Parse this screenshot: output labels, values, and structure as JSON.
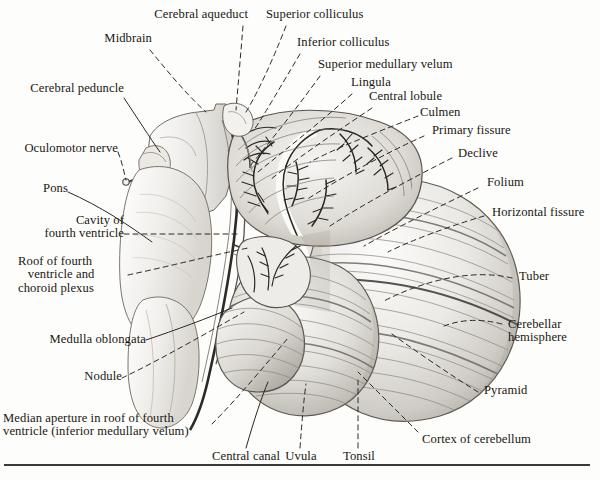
{
  "figure": {
    "background_color": "#fdfdfc",
    "ink_color": "#1a1710",
    "rule_color": "#3a3a3a"
  },
  "labels": [
    {
      "id": "cerebral-aqueduct",
      "text": "Cerebral aqueduct",
      "align": "right"
    },
    {
      "id": "superior-colliculus",
      "text": "Superior colliculus",
      "align": "left"
    },
    {
      "id": "midbrain",
      "text": "Midbrain",
      "align": "right"
    },
    {
      "id": "inferior-colliculus",
      "text": "Inferior colliculus",
      "align": "left"
    },
    {
      "id": "superior-medullary-velum",
      "text": "Superior medullary velum",
      "align": "left"
    },
    {
      "id": "lingula",
      "text": "Lingula",
      "align": "left"
    },
    {
      "id": "central-lobule",
      "text": "Central lobule",
      "align": "left"
    },
    {
      "id": "cerebral-peduncle",
      "text": "Cerebral peduncle",
      "align": "right"
    },
    {
      "id": "culmen",
      "text": "Culmen",
      "align": "left"
    },
    {
      "id": "primary-fissure",
      "text": "Primary fissure",
      "align": "left"
    },
    {
      "id": "oculomotor-nerve",
      "text": "Oculomotor nerve",
      "align": "right"
    },
    {
      "id": "declive",
      "text": "Declive",
      "align": "left"
    },
    {
      "id": "folium",
      "text": "Folium",
      "align": "left"
    },
    {
      "id": "pons",
      "text": "Pons",
      "align": "right"
    },
    {
      "id": "horizontal-fissure",
      "text": "Horizontal fissure",
      "align": "left"
    },
    {
      "id": "cavity-of-fourth-ventricle",
      "text": "Cavity of\nfourth ventricle",
      "align": "right"
    },
    {
      "id": "roof-of-fourth-ventricle",
      "text": "Roof of fourth\n   ventricle and\nchoroid plexus",
      "align": "right"
    },
    {
      "id": "tuber",
      "text": "Tuber",
      "align": "left"
    },
    {
      "id": "cerebellar-hemisphere",
      "text": "Cerebellar\nhemisphere",
      "align": "left"
    },
    {
      "id": "medulla-oblongata",
      "text": "Medulla oblongata",
      "align": "right"
    },
    {
      "id": "nodule",
      "text": "Nodule",
      "align": "right"
    },
    {
      "id": "pyramid",
      "text": "Pyramid",
      "align": "left"
    },
    {
      "id": "median-aperture",
      "text": "Median aperture in roof of fourth\nventricle (inferior medullary velum)",
      "align": "left"
    },
    {
      "id": "cortex-of-cerebellum",
      "text": "Cortex of cerebellum",
      "align": "left"
    },
    {
      "id": "central-canal",
      "text": "Central canal",
      "align": "center"
    },
    {
      "id": "uvula",
      "text": "Uvula",
      "align": "center"
    },
    {
      "id": "tonsil",
      "text": "Tonsil",
      "align": "center"
    }
  ],
  "structures": [
    {
      "id": "midbrain-body",
      "name": "Midbrain"
    },
    {
      "id": "pons-body",
      "name": "Pons"
    },
    {
      "id": "medulla-body",
      "name": "Medulla oblongata"
    },
    {
      "id": "cerebellum-vermis",
      "name": "Cerebellar vermis with arbor vitae"
    },
    {
      "id": "cerebellar-hemisphere-right",
      "name": "Right cerebellar hemisphere"
    },
    {
      "id": "cerebellar-tonsil",
      "name": "Cerebellar tonsil"
    },
    {
      "id": "fourth-ventricle",
      "name": "Fourth ventricle cavity"
    }
  ]
}
